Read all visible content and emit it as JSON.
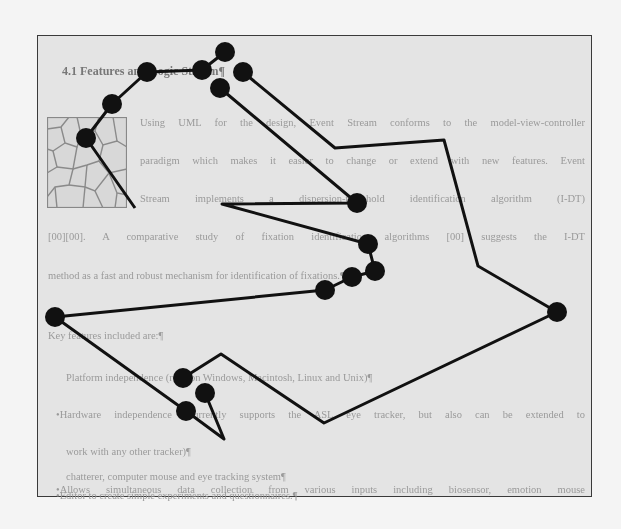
{
  "document": {
    "heading": "4.1 Features and Logic Stream¶",
    "paragraph_lines": [
      "Using UML for the design, Event Stream conforms to the model-view-controller",
      "paradigm which makes it easier to change or extend with new features. Event",
      "Stream implements a dispersion-threshold identification algorithm (I-DT)",
      "[00][00]. A comparative study of fixation identification algorithms [00] suggests the I-DT",
      "method as a fast and robust mechanism for identification of fixations.¶"
    ],
    "list_intro": "Key features included are:¶",
    "list_items": [
      "Platform independence (runs on Windows, Macintosh, Linux and Unix)¶",
      "•Hardware independence (currently supports the ASL eye tracker, but also can be extended to",
      "work with any other tracker)¶",
      "•Allows simultaneous data collection from various inputs including biosensor, emotion mouse",
      "chatterer, computer mouse and eye tracking system¶",
      "•Editor to create simple experiments and questionnaires.¶"
    ]
  },
  "thumbnail": {
    "description": "voronoi-cell-pattern-image"
  },
  "scanpath": {
    "color": "#111111",
    "fixation_radius": 10,
    "fixations": [
      [
        225,
        52
      ],
      [
        202,
        70
      ],
      [
        147,
        72
      ],
      [
        112,
        104
      ],
      [
        86,
        138
      ],
      [
        243,
        72
      ],
      [
        220,
        88
      ],
      [
        357,
        203
      ],
      [
        368,
        244
      ],
      [
        375,
        271
      ],
      [
        352,
        277
      ],
      [
        325,
        290
      ],
      [
        55,
        317
      ],
      [
        557,
        312
      ],
      [
        183,
        378
      ],
      [
        205,
        393
      ],
      [
        186,
        411
      ]
    ],
    "paths": [
      [
        [
          225,
          52
        ],
        [
          202,
          70
        ],
        [
          147,
          72
        ],
        [
          112,
          104
        ],
        [
          86,
          138
        ],
        [
          135,
          208
        ]
      ],
      [
        [
          243,
          72
        ],
        [
          335,
          148
        ],
        [
          444,
          140
        ],
        [
          478,
          266
        ],
        [
          557,
          312
        ],
        [
          324,
          423
        ],
        [
          221,
          354
        ],
        [
          183,
          378
        ]
      ],
      [
        [
          220,
          88
        ],
        [
          357,
          203
        ],
        [
          222,
          204
        ],
        [
          368,
          244
        ],
        [
          375,
          271
        ],
        [
          352,
          277
        ],
        [
          325,
          290
        ],
        [
          55,
          317
        ],
        [
          186,
          411
        ],
        [
          224,
          439
        ],
        [
          205,
          393
        ]
      ]
    ]
  }
}
